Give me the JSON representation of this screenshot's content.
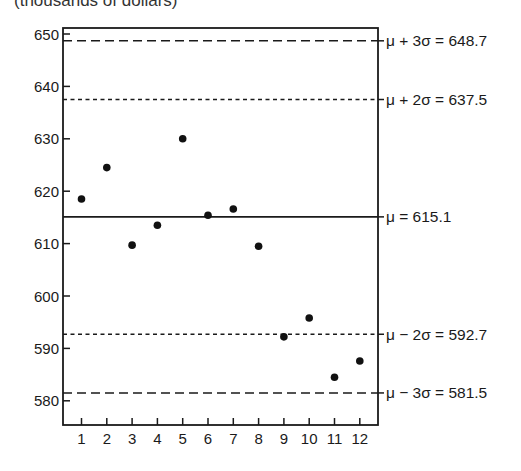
{
  "chart_data": {
    "type": "scatter",
    "title": "",
    "unit_label": "(thousands of dollars)",
    "xlabel": "",
    "ylabel": "(thousands of dollars)",
    "x": [
      1,
      2,
      3,
      4,
      5,
      6,
      7,
      8,
      9,
      10,
      11,
      12
    ],
    "values": [
      618.5,
      624.5,
      609.7,
      613.5,
      630.0,
      615.4,
      616.6,
      609.5,
      592.2,
      595.8,
      584.5,
      587.6
    ],
    "xlim": [
      0.3,
      12.7
    ],
    "ylim": [
      575.5,
      651.5
    ],
    "x_ticks": [
      "1",
      "2",
      "3",
      "4",
      "5",
      "6",
      "7",
      "8",
      "9",
      "10",
      "11",
      "12"
    ],
    "y_ticks": [
      580,
      590,
      600,
      610,
      620,
      630,
      640,
      650
    ],
    "grid": false,
    "reference_lines": [
      {
        "name": "mu_plus_3sigma",
        "label": "μ + 3σ = 648.7",
        "value": 648.7,
        "style": "dashed"
      },
      {
        "name": "mu_plus_2sigma",
        "label": "μ + 2σ = 637.5",
        "value": 637.5,
        "style": "dotted"
      },
      {
        "name": "mu",
        "label": "μ = 615.1",
        "value": 615.1,
        "style": "solid"
      },
      {
        "name": "mu_minus_2sigma",
        "label": "μ − 2σ = 592.7",
        "value": 592.7,
        "style": "dotted"
      },
      {
        "name": "mu_minus_3sigma",
        "label": "μ − 3σ = 581.5",
        "value": 581.5,
        "style": "dashed"
      }
    ],
    "colors": {
      "line": "#1a1a1a",
      "point": "#111111",
      "background": "#ffffff"
    }
  }
}
